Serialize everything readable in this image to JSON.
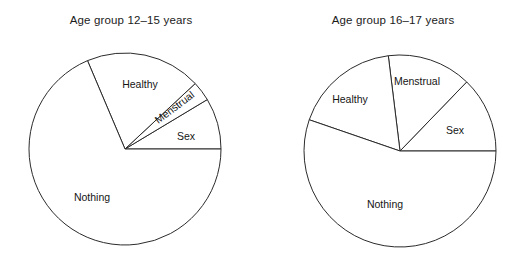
{
  "figure": {
    "width": 524,
    "height": 269,
    "background": "#ffffff",
    "stroke_color": "#2b2b2b",
    "slice_fill": "#ffffff",
    "text_color": "#151515"
  },
  "chart_data": [
    {
      "type": "pie",
      "title": "Age group 12–15 years",
      "xlabel": "",
      "ylabel": "",
      "legend": "none",
      "labels_position": "inside-slice",
      "center": {
        "x": 125,
        "y": 149
      },
      "radius": 96,
      "start_angle_deg": 0,
      "direction": "counterclockwise",
      "categories": [
        "Sex",
        "Menstrual",
        "Healthy",
        "Nothing"
      ],
      "values": [
        8.6,
        3.3,
        19.4,
        68.7
      ],
      "slices": [
        {
          "label": "Sex",
          "value": 8.6,
          "start_deg": 0,
          "end_deg": 31,
          "label_x": 186,
          "label_y": 137
        },
        {
          "label": "Menstrual",
          "value": 3.3,
          "start_deg": 31,
          "end_deg": 43,
          "label_x": 175,
          "label_y": 108,
          "label_rotation_deg": -37
        },
        {
          "label": "Healthy",
          "value": 19.4,
          "start_deg": 43,
          "end_deg": 113,
          "label_x": 140,
          "label_y": 85
        },
        {
          "label": "Nothing",
          "value": 68.7,
          "start_deg": 113,
          "end_deg": 360,
          "label_x": 92,
          "label_y": 198
        }
      ]
    },
    {
      "type": "pie",
      "title": "Age group 16–17 years",
      "xlabel": "",
      "ylabel": "",
      "legend": "none",
      "labels_position": "inside-slice",
      "center": {
        "x": 138,
        "y": 151
      },
      "radius": 96,
      "start_angle_deg": 0,
      "direction": "counterclockwise",
      "categories": [
        "Sex",
        "Menstrual",
        "Healthy",
        "Nothing"
      ],
      "values": [
        12.8,
        14.2,
        17.8,
        55.2
      ],
      "slices": [
        {
          "label": "Sex",
          "value": 12.8,
          "start_deg": 0,
          "end_deg": 46,
          "label_x": 193,
          "label_y": 131
        },
        {
          "label": "Menstrual",
          "value": 14.2,
          "start_deg": 46,
          "end_deg": 97,
          "label_x": 155,
          "label_y": 82,
          "label_rotation_deg": 0
        },
        {
          "label": "Healthy",
          "value": 17.8,
          "start_deg": 97,
          "end_deg": 161,
          "label_x": 88,
          "label_y": 100
        },
        {
          "label": "Nothing",
          "value": 55.2,
          "start_deg": 161,
          "end_deg": 360,
          "label_x": 123,
          "label_y": 205
        }
      ]
    }
  ]
}
